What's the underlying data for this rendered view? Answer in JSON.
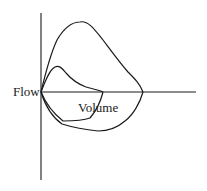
{
  "diagram": {
    "type": "flow-volume loop",
    "labels": {
      "flow": "Flow",
      "volume": "Volume"
    },
    "curves": [
      {
        "name": "large-loop",
        "description": "Larger flow-volume loop (expiratory peak above axis, inspiratory limb below)"
      },
      {
        "name": "small-loop",
        "description": "Smaller flow-volume loop nested inside the larger loop"
      }
    ],
    "colors": {
      "stroke": "#1a1a1a",
      "background": "#ffffff"
    }
  }
}
